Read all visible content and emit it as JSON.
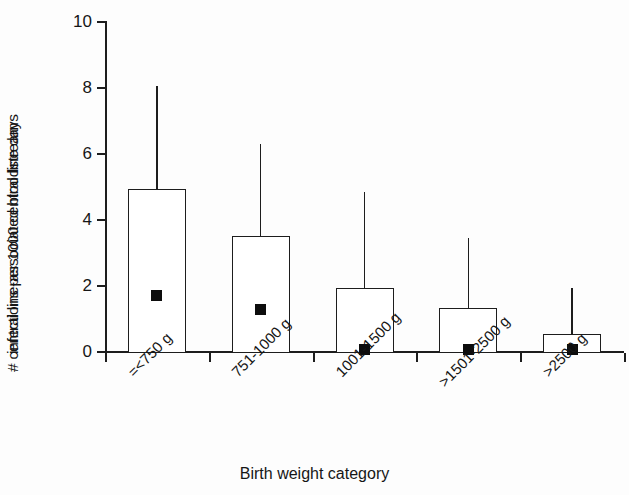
{
  "chart_data": {
    "type": "bar",
    "title": "",
    "xlabel": "Birth weight category",
    "ylabel_line1": "# central line-associated bloodstream",
    "ylabel_line2": "infections per 1000 central line days",
    "categories": [
      "=<750 g",
      "751-1000 g",
      "1001-1500 g",
      ">1501-2500 g",
      ">2500 g"
    ],
    "values": [
      4.94,
      3.52,
      1.94,
      1.33,
      0.55
    ],
    "upper_error": [
      8.05,
      6.3,
      4.85,
      3.45,
      1.95
    ],
    "markers": [
      1.72,
      1.3,
      0.08,
      0.08,
      0.08
    ],
    "series": [
      {
        "name": "Rate (bar top)",
        "values": [
          4.94,
          3.52,
          1.94,
          1.33,
          0.55
        ]
      },
      {
        "name": "Upper confidence limit (whisker top)",
        "values": [
          8.05,
          6.3,
          4.85,
          3.45,
          1.95
        ]
      },
      {
        "name": "Median / point estimate (square marker)",
        "values": [
          1.72,
          1.3,
          0.08,
          0.08,
          0.08
        ]
      }
    ],
    "ylim": [
      0,
      10
    ],
    "yticks": [
      0,
      2,
      4,
      6,
      8,
      10
    ],
    "ytick_labels": [
      "0",
      "2",
      "4",
      "6",
      "8",
      "10"
    ],
    "grid": false,
    "legend": "none",
    "colors": {
      "bar_fill": "#ffffff",
      "bar_stroke": "#1d1d1d",
      "marker": "#0d0d0d",
      "axis": "#1d1d1d",
      "background": "#fdfdfd"
    }
  }
}
